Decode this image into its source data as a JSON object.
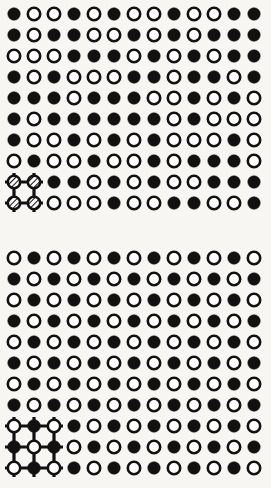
{
  "figure": {
    "name": "binary-alloy-lattice-order-disorder-diagram",
    "background_color": "#f7f6f2",
    "ink_color": "#111111",
    "open_fill_color": "#ffffff",
    "site_radius": 6.2,
    "open_site_stroke_width": 2.6,
    "columns": 13,
    "column_x_start": 14,
    "column_spacing": 20,
    "panels": [
      {
        "id": "upper-panel",
        "label": "disordered-solid-solution",
        "rows": 10,
        "row_y_start": 14,
        "row_spacing": 21,
        "unit_cell": {
          "id": "upper-unit-cell",
          "type": "2x2-square-unit-cell",
          "node_columns": [
            0,
            1
          ],
          "node_rows": [
            8,
            9
          ],
          "node_style": "hatched",
          "whisker_length": 9,
          "bond_width": 3.2
        },
        "grid": [
          [
            1,
            0,
            0,
            1,
            0,
            1,
            0,
            0,
            1,
            0,
            0,
            1,
            1
          ],
          [
            1,
            0,
            1,
            1,
            0,
            0,
            1,
            0,
            1,
            0,
            1,
            1,
            1
          ],
          [
            0,
            0,
            0,
            1,
            1,
            1,
            0,
            1,
            0,
            1,
            0,
            1,
            1
          ],
          [
            1,
            0,
            1,
            0,
            0,
            0,
            1,
            1,
            0,
            1,
            1,
            0,
            1
          ],
          [
            1,
            1,
            1,
            0,
            1,
            1,
            1,
            0,
            0,
            1,
            0,
            1,
            0
          ],
          [
            1,
            0,
            1,
            1,
            1,
            1,
            1,
            1,
            0,
            1,
            0,
            0,
            0
          ],
          [
            1,
            0,
            0,
            1,
            0,
            1,
            0,
            1,
            0,
            0,
            0,
            1,
            0
          ],
          [
            0,
            1,
            0,
            0,
            1,
            0,
            0,
            1,
            0,
            1,
            1,
            1,
            0
          ],
          [
            0,
            0,
            1,
            1,
            0,
            1,
            0,
            1,
            0,
            0,
            1,
            1,
            1
          ],
          [
            0,
            0,
            0,
            0,
            0,
            1,
            0,
            0,
            1,
            1,
            0,
            0,
            1
          ]
        ]
      },
      {
        "id": "lower-panel",
        "label": "ordered-superlattice",
        "rows": 11,
        "row_y_start": 258,
        "row_spacing": 21,
        "unit_cell": {
          "id": "lower-unit-cell",
          "type": "3x3-square-unit-cell",
          "node_columns": [
            0,
            1,
            2
          ],
          "node_rows": [
            8,
            9,
            10
          ],
          "node_style": "mixed",
          "whisker_length": 9,
          "bond_width": 3.2
        },
        "grid": [
          [
            0,
            1,
            0,
            1,
            0,
            1,
            0,
            1,
            0,
            1,
            0,
            1,
            0
          ],
          [
            1,
            0,
            1,
            0,
            1,
            0,
            1,
            0,
            1,
            0,
            1,
            0,
            1
          ],
          [
            0,
            1,
            0,
            1,
            0,
            1,
            0,
            1,
            0,
            1,
            0,
            1,
            0
          ],
          [
            1,
            0,
            1,
            0,
            1,
            0,
            1,
            0,
            1,
            0,
            1,
            0,
            1
          ],
          [
            0,
            1,
            0,
            1,
            0,
            1,
            0,
            1,
            0,
            1,
            0,
            1,
            0
          ],
          [
            1,
            0,
            1,
            0,
            1,
            0,
            1,
            0,
            1,
            0,
            1,
            0,
            1
          ],
          [
            0,
            1,
            0,
            1,
            0,
            1,
            0,
            1,
            0,
            1,
            0,
            1,
            0
          ],
          [
            1,
            0,
            1,
            0,
            1,
            0,
            1,
            0,
            1,
            0,
            1,
            0,
            1
          ],
          [
            0,
            1,
            0,
            1,
            0,
            1,
            0,
            1,
            0,
            1,
            0,
            1,
            0
          ],
          [
            1,
            0,
            1,
            0,
            1,
            0,
            1,
            0,
            1,
            0,
            1,
            0,
            1
          ],
          [
            0,
            1,
            0,
            1,
            0,
            1,
            0,
            1,
            0,
            1,
            0,
            1,
            0
          ]
        ]
      }
    ],
    "legend": {
      "filled_site_meaning": "filled-atom-site",
      "open_site_meaning": "open-atom-site",
      "hatched_site_meaning": "unit-cell-corner-site"
    }
  }
}
